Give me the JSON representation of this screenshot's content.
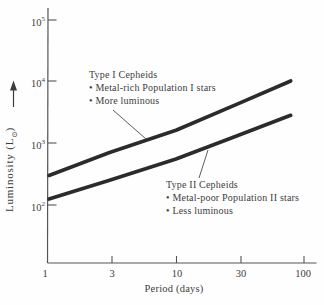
{
  "figure": {
    "background": "#fefefe",
    "ink": "#3d3d3d",
    "axis_color": "#555555",
    "curve_color": "#2b2b2b"
  },
  "axes": {
    "y": {
      "title_main": "Luminosity (L",
      "title_sub": "⊙",
      "title_end": ")",
      "ticks": [
        {
          "base": "10",
          "exp": "5"
        },
        {
          "base": "10",
          "exp": "4"
        },
        {
          "base": "10",
          "exp": "3"
        },
        {
          "base": "10",
          "exp": "2"
        }
      ]
    },
    "x": {
      "title": "Period (days)",
      "ticks": [
        "1",
        "3",
        "10",
        "30",
        "100"
      ]
    }
  },
  "annotations": {
    "type1": {
      "title": "Type I Cepheids",
      "bullets": [
        "• Metal-rich Population I stars",
        "• More luminous"
      ]
    },
    "type2": {
      "title": "Type II Cepheids",
      "bullets": [
        "• Metal-poor Population II stars",
        "• Less luminous"
      ]
    }
  },
  "chart_data": {
    "type": "line",
    "title": "",
    "xlabel": "Period (days)",
    "ylabel": "Luminosity (L⊙)",
    "x_scale": "log",
    "y_scale": "log",
    "xlim": [
      1,
      100
    ],
    "ylim": [
      100,
      100000
    ],
    "grid": false,
    "legend_position": "none",
    "x": [
      1,
      3,
      10,
      30,
      80
    ],
    "series": [
      {
        "name": "Type I Cepheids",
        "values": [
          300,
          700,
          1600,
          4200,
          10000
        ]
      },
      {
        "name": "Type II Cepheids",
        "values": [
          125,
          250,
          550,
          1300,
          2800
        ]
      }
    ]
  }
}
